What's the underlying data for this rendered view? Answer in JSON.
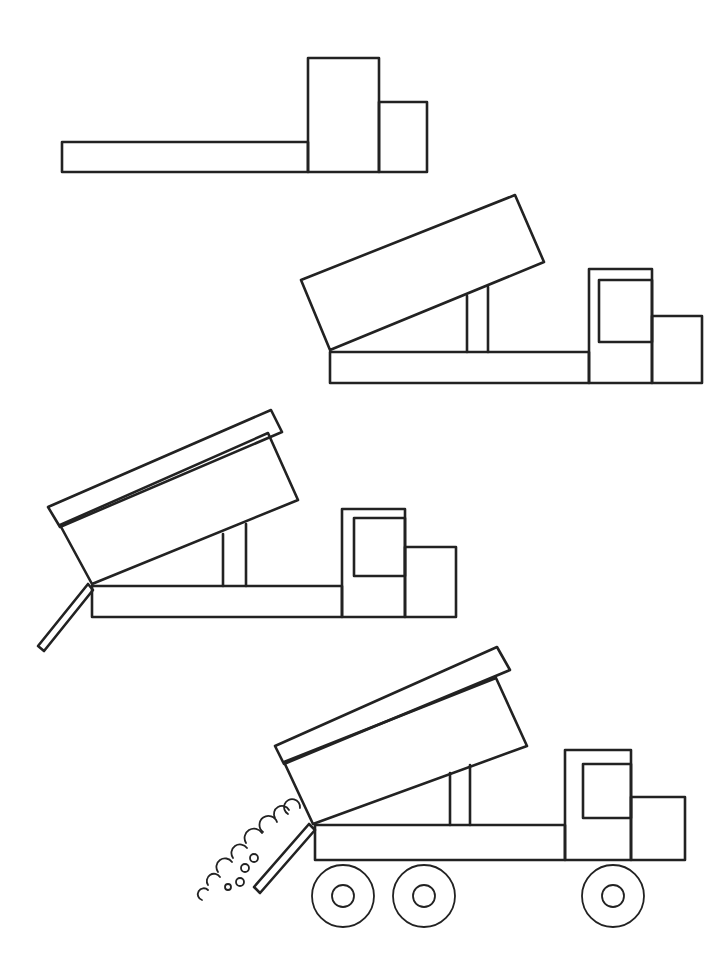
{
  "page": {
    "background": "#ffffff",
    "stroke": "#222222"
  },
  "steps": [
    {
      "id": 1,
      "description": "chassis and cab blocks"
    },
    {
      "id": 2,
      "description": "tilted dump bed, lift piston, cab window"
    },
    {
      "id": 3,
      "description": "bed rim and open tailgate"
    },
    {
      "id": 4,
      "description": "wheels and dumped load"
    }
  ]
}
